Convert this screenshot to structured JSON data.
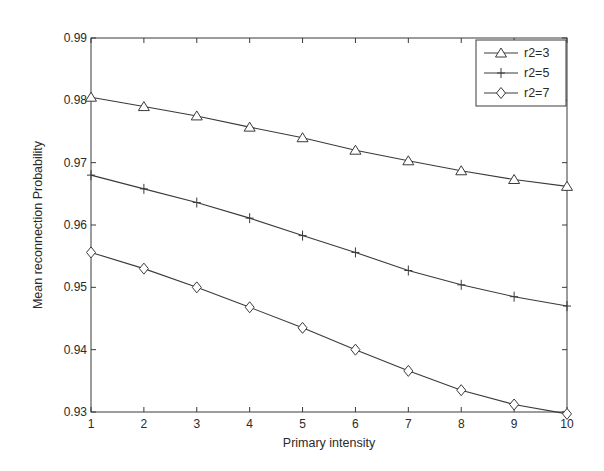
{
  "chart_data": {
    "type": "line",
    "title": "",
    "xlabel": "Primary intensity",
    "ylabel": "Mean reconnection Probability",
    "x": [
      1,
      2,
      3,
      4,
      5,
      6,
      7,
      8,
      9,
      10
    ],
    "xlim": [
      1,
      10
    ],
    "ylim": [
      0.93,
      0.99
    ],
    "xticks": [
      "1",
      "2",
      "3",
      "4",
      "5",
      "6",
      "7",
      "8",
      "9",
      "10"
    ],
    "yticks": [
      "0.93",
      "0.94",
      "0.95",
      "0.96",
      "0.97",
      "0.98",
      "0.99"
    ],
    "grid": false,
    "legend_position": "upper right",
    "series": [
      {
        "name": "r2=3",
        "marker": "triangle",
        "values": [
          0.9805,
          0.979,
          0.9775,
          0.9757,
          0.974,
          0.972,
          0.9703,
          0.9687,
          0.9673,
          0.9662
        ]
      },
      {
        "name": "r2=5",
        "marker": "plus",
        "values": [
          0.968,
          0.9658,
          0.9636,
          0.9611,
          0.9583,
          0.9556,
          0.9527,
          0.9504,
          0.9485,
          0.947
        ]
      },
      {
        "name": "r2=7",
        "marker": "diamond",
        "values": [
          0.9556,
          0.953,
          0.95,
          0.9468,
          0.9435,
          0.94,
          0.9366,
          0.9335,
          0.9312,
          0.9297
        ]
      }
    ],
    "colors": {
      "line": "#3a3a3a",
      "axis": "#3a3a3a",
      "background": "#ffffff"
    }
  }
}
